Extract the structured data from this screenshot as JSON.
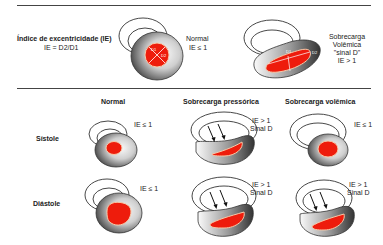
{
  "top": {
    "title": "Índice de excentricidade (IE)",
    "formula": "IE = D2/D1",
    "normal": {
      "label": "Normal",
      "value": "IE ≤ 1",
      "d1": "D1",
      "d2": "D2"
    },
    "overload": {
      "line1": "Sobrecarga",
      "line2": "Volêmica",
      "line3": "\"sinal D\"",
      "value": "IE > 1",
      "d1": "D1",
      "d2": "D2"
    }
  },
  "grid": {
    "columns": [
      "Normal",
      "Sobrecarga pressórica",
      "Sobrecarga volêmica"
    ],
    "rows": [
      {
        "label": "Sístole",
        "cells": [
          {
            "ie": "IE ≤ 1",
            "sign": ""
          },
          {
            "ie": "IE > 1",
            "sign": "Sinal D"
          },
          {
            "ie": "IE ≤ 1",
            "sign": ""
          }
        ]
      },
      {
        "label": "Diástole",
        "cells": [
          {
            "ie": "IE ≤ 1",
            "sign": ""
          },
          {
            "ie": "IE > 1",
            "sign": "Sinal D"
          },
          {
            "ie": "IE > 1",
            "sign": "Sinal D"
          }
        ]
      }
    ]
  },
  "colors": {
    "cavity": "#ee1c0c",
    "cavity_edge": "#f7c9a8",
    "wall_dark": "#3a3a3a",
    "wall_light": "#ffffff"
  }
}
